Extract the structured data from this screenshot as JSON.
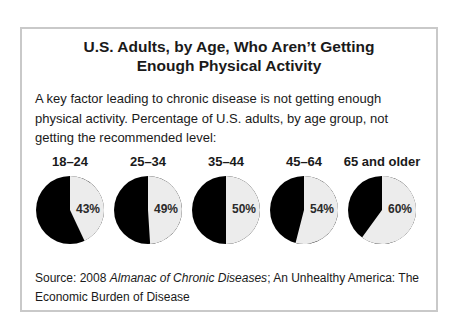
{
  "title_line1": "U.S. Adults, by Age, Who Aren’t Getting",
  "title_line2": "Enough Physical Activity",
  "description": "A key factor leading to chronic disease is not getting enough physical activity. Percentage of U.S. adults, by age group, not getting the recommended level:",
  "source": {
    "prefix": "Source: 2008 ",
    "italic": "Almanac of Chronic Diseases",
    "suffix": "; An Unhealthy America: The Economic Burden of Disease"
  },
  "colors": {
    "filled": "#ececec",
    "remainder": "#000000",
    "border": "#c9c9c9"
  },
  "chart_data": {
    "type": "pie",
    "title": "U.S. Adults, by Age, Who Aren’t Getting Enough Physical Activity",
    "categories": [
      "18–24",
      "25–34",
      "35–44",
      "45–64",
      "65 and older"
    ],
    "values": [
      43,
      49,
      50,
      54,
      60
    ],
    "value_labels": [
      "43%",
      "49%",
      "50%",
      "54%",
      "60%"
    ],
    "unit": "%",
    "series_description": "Percentage of U.S. adults not getting the recommended level of physical activity (light wedge, clockwise from top); remainder in black",
    "legend": "none"
  }
}
